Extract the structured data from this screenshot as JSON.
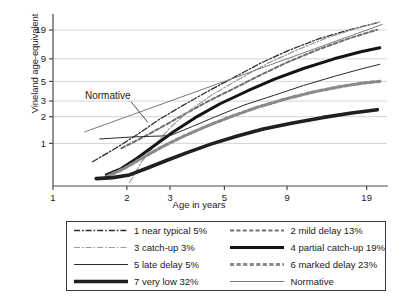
{
  "chart_data": {
    "type": "line",
    "title": "",
    "xlabel": "Age in years",
    "ylabel": "Vineland age-equivalent",
    "xscale": "log",
    "yscale": "log",
    "xticks": [
      1,
      2,
      3,
      5,
      9,
      19
    ],
    "xticklabels": [
      "1",
      "2",
      "3",
      "5",
      "9",
      "19"
    ],
    "yticks": [
      1,
      2,
      3,
      5,
      9,
      19
    ],
    "yticklabels": [
      "1",
      "2",
      "3",
      "5",
      "9",
      "19"
    ],
    "xlim": [
      1,
      23
    ],
    "ylim": [
      0.33,
      26
    ],
    "grid": "horizontal",
    "legend_position": "below-axes",
    "annotations": [
      {
        "text": "Normative",
        "x": 1.35,
        "y": 3.2
      }
    ],
    "series": [
      {
        "name": "1 near typical 5%",
        "style": "dash-dot",
        "color": "#2b2b2b",
        "width": 1.3,
        "x": [
          1.45,
          1.8,
          2.2,
          2.7,
          3.4,
          4.3,
          5.5,
          7.0,
          9.0,
          12.0,
          16.0,
          21.0
        ],
        "values": [
          0.62,
          0.88,
          1.25,
          1.85,
          2.7,
          3.9,
          5.6,
          8.0,
          11.0,
          15.0,
          19.0,
          23.0
        ]
      },
      {
        "name": "2 mild delay 13%",
        "style": "dashed",
        "color": "#6e6e6e",
        "width": 2.0,
        "x": [
          1.9,
          2.3,
          2.8,
          3.4,
          4.3,
          5.5,
          7.0,
          9.0,
          12.0,
          16.0,
          21.0
        ],
        "values": [
          0.88,
          1.15,
          1.55,
          2.1,
          3.0,
          4.2,
          5.9,
          8.2,
          11.4,
          15.2,
          19.2
        ]
      },
      {
        "name": "3 catch-up 3%",
        "style": "dash-dot",
        "color": "#9a9a9a",
        "width": 1.2,
        "x": [
          2.05,
          2.3,
          2.6,
          3.0,
          3.6,
          4.5,
          5.8,
          7.5,
          9.8,
          13.0,
          17.0,
          21.5
        ],
        "values": [
          0.36,
          0.62,
          0.95,
          1.5,
          2.35,
          3.6,
          5.4,
          8.0,
          11.2,
          15.4,
          19.6,
          23.5
        ]
      },
      {
        "name": "4 partial catch-up 19%",
        "style": "solid",
        "color": "#141414",
        "width": 3.0,
        "x": [
          1.65,
          1.9,
          2.2,
          2.6,
          3.1,
          3.8,
          4.8,
          6.2,
          8.0,
          10.5,
          14.0,
          18.0,
          21.5
        ],
        "values": [
          0.44,
          0.52,
          0.68,
          0.95,
          1.35,
          1.95,
          2.8,
          3.9,
          5.3,
          7.0,
          9.0,
          10.8,
          12.0
        ]
      },
      {
        "name": "5 late delay 5%",
        "style": "solid",
        "color": "#2b2b2b",
        "width": 1.0,
        "x": [
          1.55,
          1.8,
          2.1,
          2.5,
          3.0,
          3.7,
          4.6,
          6.0,
          8.0,
          10.5,
          14.0,
          18.0,
          21.5
        ],
        "values": [
          1.12,
          1.15,
          1.18,
          1.2,
          1.22,
          1.55,
          2.0,
          2.7,
          3.5,
          4.5,
          5.7,
          6.9,
          7.8
        ]
      },
      {
        "name": "6 marked delay 23%",
        "style": "dashed",
        "color": "#8a8a8a",
        "width": 3.2,
        "x": [
          1.65,
          1.95,
          2.3,
          2.8,
          3.4,
          4.2,
          5.3,
          6.8,
          8.8,
          11.5,
          15.0,
          19.0,
          21.5
        ],
        "values": [
          0.42,
          0.52,
          0.68,
          0.92,
          1.2,
          1.55,
          2.0,
          2.55,
          3.15,
          3.8,
          4.4,
          4.85,
          5.0
        ]
      },
      {
        "name": "7 very low 32%",
        "style": "solid",
        "color": "#1f1f1f",
        "width": 3.6,
        "x": [
          1.5,
          1.75,
          2.05,
          2.4,
          2.9,
          3.5,
          4.4,
          5.6,
          7.2,
          9.5,
          12.5,
          16.5,
          21.0
        ],
        "values": [
          0.4,
          0.41,
          0.44,
          0.52,
          0.64,
          0.78,
          0.98,
          1.2,
          1.45,
          1.7,
          1.95,
          2.2,
          2.4
        ]
      },
      {
        "name": "Normative",
        "style": "solid",
        "color": "#7a7a7a",
        "width": 1.0,
        "x": [
          1.35,
          2.0,
          3.0,
          5.0,
          9.0,
          15.0,
          22.0
        ],
        "values": [
          1.35,
          2.0,
          3.0,
          5.0,
          9.0,
          15.0,
          22.0
        ]
      }
    ]
  },
  "axes": {
    "ylabel": "Vineland age-equivalent",
    "xlabel": "Age in years",
    "xticklabels": [
      "1",
      "2",
      "3",
      "5",
      "9",
      "19"
    ],
    "yticklabels": [
      "1",
      "2",
      "3",
      "5",
      "9",
      "19"
    ]
  },
  "annotation": {
    "normative_label": "Normative"
  },
  "legend": {
    "items": [
      {
        "label": "1 near typical 5%",
        "style": "dash-dot",
        "color": "#2b2b2b",
        "width": 1.3
      },
      {
        "label": "2 mild delay 13%",
        "style": "dashed",
        "color": "#6e6e6e",
        "width": 2.0
      },
      {
        "label": "3 catch-up 3%",
        "style": "dash-dot",
        "color": "#9a9a9a",
        "width": 1.2
      },
      {
        "label": "4 partial catch-up 19%",
        "style": "solid",
        "color": "#141414",
        "width": 3.0
      },
      {
        "label": "5 late delay 5%",
        "style": "solid",
        "color": "#2b2b2b",
        "width": 1.0
      },
      {
        "label": "6 marked delay 23%",
        "style": "dashed",
        "color": "#8a8a8a",
        "width": 3.2
      },
      {
        "label": "7 very low 32%",
        "style": "solid",
        "color": "#1f1f1f",
        "width": 3.6
      },
      {
        "label": "Normative",
        "style": "solid",
        "color": "#7a7a7a",
        "width": 1.0
      }
    ]
  },
  "colors": {
    "background": "#ffffff",
    "axis": "#4a4a4a",
    "grid": "#c9c9c9",
    "text": "#1a1a1a",
    "legend_border": "#3a3a3a"
  }
}
